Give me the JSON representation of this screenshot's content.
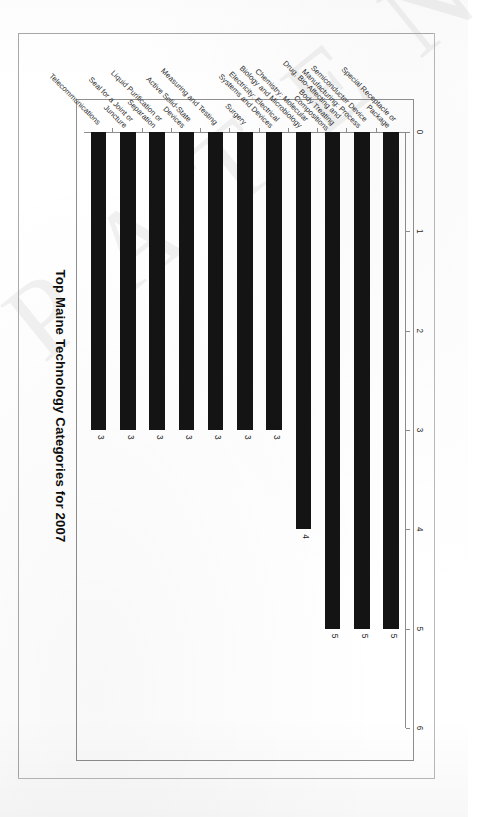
{
  "document": {
    "type": "scanned-page",
    "watermark_text": "P A T E N T"
  },
  "chart_data": {
    "type": "bar",
    "orientation": "horizontal",
    "title": "Top Maine Technology Categories for 2007",
    "xlabel": "",
    "ylabel": "",
    "xlim": [
      0,
      6
    ],
    "grid": false,
    "legend": false,
    "tick_labels": [
      "0",
      "1",
      "2",
      "3",
      "4",
      "5",
      "6"
    ],
    "ticks": [
      0,
      1,
      2,
      3,
      4,
      5,
      6
    ],
    "bar_color": "#141414",
    "categories": [
      "Special Receptacle or\nPackage",
      "Semiconductor Device\nManufacturing: Process",
      "Drug, Bio-Affecting and\nBody Treating\nCompositions",
      "Chemistry: Molecular\nBiology and Microbiology",
      "Electricity: Electrical\nSystems and Devices",
      "Surgery",
      "Measuring and Testing",
      "Active Solid-State\nDevices",
      "Liquid Purification or\nSeparation",
      "Seal for a Joint or\nJuncture",
      "Telecommunications"
    ],
    "values": [
      5,
      5,
      5,
      4,
      3,
      3,
      3,
      3,
      3,
      3,
      3
    ],
    "value_labels": [
      "5",
      "5",
      "5",
      "4",
      "3",
      "3",
      "3",
      "3",
      "3",
      "3",
      "3"
    ]
  }
}
